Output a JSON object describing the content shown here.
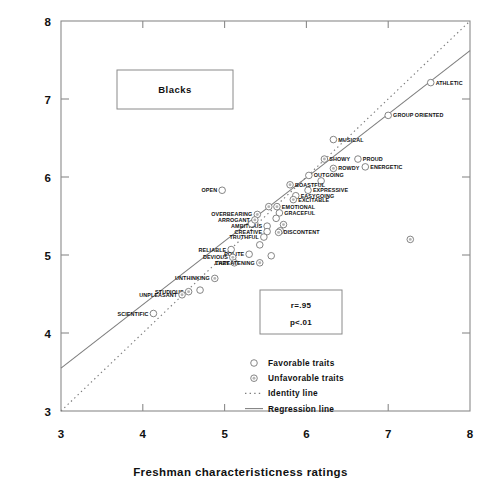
{
  "chart_data": {
    "type": "scatter",
    "title": "Blacks",
    "xlabel": "Freshman characteristicness ratings",
    "ylabel": "Senior characteristicness ratings",
    "xlim": [
      3,
      8
    ],
    "ylim": [
      3,
      8
    ],
    "xticks": [
      3,
      4,
      5,
      6,
      7,
      8
    ],
    "yticks": [
      3,
      4,
      5,
      6,
      7,
      8
    ],
    "grid": false,
    "annotations": {
      "r": "r=.95",
      "p": "p<.01"
    },
    "legend": {
      "position": "bottom-right",
      "entries": [
        {
          "label": "Favorable traits",
          "marker": "open-circle"
        },
        {
          "label": "Unfavorable traits",
          "marker": "dotted-circle"
        },
        {
          "label": "Identity line",
          "marker": "dotted-line"
        },
        {
          "label": "Regression line",
          "marker": "solid-line"
        }
      ]
    },
    "lines": [
      {
        "name": "Identity line",
        "style": "dotted",
        "x": [
          3.0,
          8.0
        ],
        "y": [
          3.0,
          8.0
        ]
      },
      {
        "name": "Regression line",
        "style": "solid",
        "x": [
          3.0,
          8.0
        ],
        "y": [
          3.55,
          7.62
        ]
      }
    ],
    "series": [
      {
        "name": "Favorable traits",
        "marker": "open-circle",
        "points": [
          {
            "label": "ATHLETIC",
            "x": 7.52,
            "y": 7.21,
            "label_side": "right"
          },
          {
            "label": "GROUP ORIENTED",
            "x": 7.0,
            "y": 6.79,
            "label_side": "right"
          },
          {
            "label": "MUSICAL",
            "x": 6.33,
            "y": 6.48,
            "label_side": "right"
          },
          {
            "label": "PROUD",
            "x": 6.63,
            "y": 6.23,
            "label_side": "right"
          },
          {
            "label": "ENERGETIC",
            "x": 6.72,
            "y": 6.13,
            "label_side": "right"
          },
          {
            "label": "OUTGOING",
            "x": 6.03,
            "y": 6.02,
            "label_side": "right"
          },
          {
            "label": "EXPRESSIVE",
            "x": 6.02,
            "y": 5.83,
            "label_side": "right"
          },
          {
            "label": "EASYGOING",
            "x": 5.87,
            "y": 5.76,
            "label_side": "right"
          },
          {
            "label": "GRACEFUL",
            "x": 5.67,
            "y": 5.54,
            "label_side": "right"
          },
          {
            "label": "OPEN",
            "x": 4.97,
            "y": 5.83,
            "label_side": "left"
          },
          {
            "label": "AMBITIOUS",
            "x": 5.52,
            "y": 5.37,
            "label_side": "left"
          },
          {
            "label": "CREATIVE",
            "x": 5.52,
            "y": 5.3,
            "label_side": "left"
          },
          {
            "label": "TRUTHFUL",
            "x": 5.48,
            "y": 5.23,
            "label_side": "left"
          },
          {
            "label": "RELIABLE",
            "x": 5.08,
            "y": 5.07,
            "label_side": "left"
          },
          {
            "label": "POLITE",
            "x": 5.3,
            "y": 5.01,
            "label_side": "left"
          },
          {
            "label": "SCIENTIFIC",
            "x": 4.13,
            "y": 4.25,
            "label_side": "left"
          },
          {
            "label": "",
            "x": 5.63,
            "y": 5.47,
            "label_side": "right"
          },
          {
            "label": "",
            "x": 5.33,
            "y": 5.4,
            "label_side": "right"
          },
          {
            "label": "",
            "x": 5.68,
            "y": 5.31,
            "label_side": "right"
          },
          {
            "label": "",
            "x": 5.43,
            "y": 5.13,
            "label_side": "right"
          },
          {
            "label": "",
            "x": 5.57,
            "y": 4.99,
            "label_side": "right"
          },
          {
            "label": "",
            "x": 4.7,
            "y": 4.55,
            "label_side": "right"
          },
          {
            "label": "",
            "x": 6.18,
            "y": 5.95,
            "label_side": "right"
          }
        ]
      },
      {
        "name": "Unfavorable traits",
        "marker": "dotted-circle",
        "points": [
          {
            "label": "SHOWY",
            "x": 6.22,
            "y": 6.23,
            "label_side": "right"
          },
          {
            "label": "ROWDY",
            "x": 6.33,
            "y": 6.11,
            "label_side": "right"
          },
          {
            "label": "BOASTFUL",
            "x": 5.8,
            "y": 5.9,
            "label_side": "right"
          },
          {
            "label": "EXCITABLE",
            "x": 5.84,
            "y": 5.71,
            "label_side": "right"
          },
          {
            "label": "EMOTIONAL",
            "x": 5.64,
            "y": 5.62,
            "label_side": "right"
          },
          {
            "label": "DISCONTENT",
            "x": 5.66,
            "y": 5.29,
            "label_side": "right"
          },
          {
            "label": "OVERBEARING",
            "x": 5.4,
            "y": 5.52,
            "label_side": "left"
          },
          {
            "label": "ARROGANT",
            "x": 5.37,
            "y": 5.45,
            "label_side": "left"
          },
          {
            "label": "DEVIOUS",
            "x": 5.1,
            "y": 4.97,
            "label_side": "left"
          },
          {
            "label": "LAZY",
            "x": 5.12,
            "y": 4.9,
            "label_side": "left"
          },
          {
            "label": "THREATENING",
            "x": 5.43,
            "y": 4.9,
            "label_side": "left"
          },
          {
            "label": "UNTHINKING",
            "x": 4.88,
            "y": 4.7,
            "label_side": "left"
          },
          {
            "label": "STUDIOUS",
            "x": 4.56,
            "y": 4.53,
            "label_side": "left"
          },
          {
            "label": "UNPLEASANT",
            "x": 4.48,
            "y": 4.49,
            "label_side": "left"
          },
          {
            "label": "",
            "x": 5.72,
            "y": 5.39,
            "label_side": "right"
          },
          {
            "label": "",
            "x": 5.54,
            "y": 5.62,
            "label_side": "right"
          },
          {
            "label": "",
            "x": 7.27,
            "y": 5.2,
            "label_side": "right"
          }
        ]
      }
    ]
  }
}
